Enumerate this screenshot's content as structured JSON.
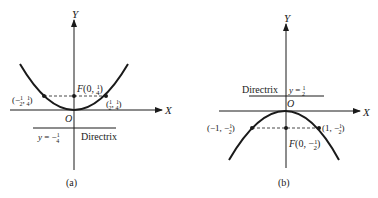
{
  "panels": [
    {
      "id": "a",
      "caption": "(a)",
      "axis_x": "X",
      "axis_y": "Y",
      "origin": "O",
      "equation": "y = x^2",
      "focus_label": "F(0, 1/4)",
      "focus_prefix": "F(0, ",
      "focus_frac": "1/4",
      "left_point": "(−1/2, 1/4)",
      "right_point": "(1/2, 1/4)",
      "directrix_eq": "y = −1/4",
      "directrix_label": "Directrix"
    },
    {
      "id": "b",
      "caption": "(b)",
      "axis_x": "X",
      "axis_y": "Y",
      "origin": "O",
      "equation": "y = −x^2/2",
      "focus_label": "F(0, −1/2)",
      "left_point": "(−1, −1/2)",
      "right_point": "(1, −1/2)",
      "directrix_eq": "y = 1/2",
      "directrix_label": "Directrix"
    }
  ],
  "colors": {
    "ink": "#1a1a1a",
    "background": "#ffffff"
  }
}
